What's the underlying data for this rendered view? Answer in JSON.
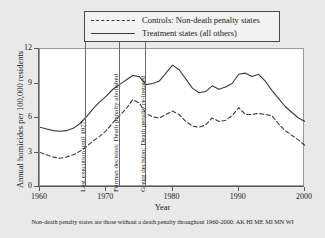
{
  "legend": {
    "items": [
      {
        "label": "Controls: Non-death penalty states",
        "style": "dashed",
        "key_name": "dashed-line-key"
      },
      {
        "label": "Treatment states (all others)",
        "style": "solid",
        "key_name": "solid-line-key"
      }
    ]
  },
  "axes": {
    "ylabel": "Annual homicides per 100,000 residents",
    "xlabel": "Year",
    "yticks": [
      "0",
      "3",
      "6",
      "9",
      "12"
    ],
    "xticks": [
      "1960",
      "1970",
      "1980",
      "1990",
      "2000"
    ]
  },
  "annotations": [
    {
      "year": 1967,
      "text": "Last execution until 1977"
    },
    {
      "year": 1972,
      "text": "Furman decision: Death penalty abolished"
    },
    {
      "year": 1976,
      "text": "Gregg decision: Death penalty re-instated"
    }
  ],
  "footnote": "Non-death penalty states are those without a death penalty throughout 1960-2000: AK HI ME MI MN WI",
  "colors": {
    "treatment_line": "#3a3a3a",
    "control_line": "#3a3a3a",
    "event_line": "#6a6a6a",
    "plot_background": "#ffffff",
    "figure_background": "#e9e9e9",
    "axis": "#5a5a5a"
  },
  "chart_data": {
    "type": "line",
    "title": "",
    "xlabel": "Year",
    "ylabel": "Annual homicides per 100,000 residents",
    "xlim": [
      1960,
      2000
    ],
    "ylim": [
      0,
      12
    ],
    "grid": false,
    "legend_position": "top-center",
    "x": [
      1960,
      1961,
      1962,
      1963,
      1964,
      1965,
      1966,
      1967,
      1968,
      1969,
      1970,
      1971,
      1972,
      1973,
      1974,
      1975,
      1976,
      1977,
      1978,
      1979,
      1980,
      1981,
      1982,
      1983,
      1984,
      1985,
      1986,
      1987,
      1988,
      1989,
      1990,
      1991,
      1992,
      1993,
      1994,
      1995,
      1996,
      1997,
      1998,
      1999,
      2000
    ],
    "series": [
      {
        "name": "Treatment states (all others)",
        "style": "solid",
        "values": [
          5.2,
          5.05,
          4.9,
          4.85,
          4.9,
          5.1,
          5.5,
          6.1,
          6.8,
          7.4,
          7.9,
          8.5,
          8.9,
          9.3,
          9.7,
          9.6,
          8.9,
          9.0,
          9.2,
          9.9,
          10.6,
          10.2,
          9.4,
          8.6,
          8.2,
          8.3,
          8.8,
          8.5,
          8.7,
          9.0,
          9.8,
          9.9,
          9.6,
          9.8,
          9.2,
          8.4,
          7.7,
          7.0,
          6.5,
          6.0,
          5.7
        ]
      },
      {
        "name": "Controls: Non-death penalty states",
        "style": "dashed",
        "values": [
          3.0,
          2.8,
          2.6,
          2.5,
          2.6,
          2.8,
          3.1,
          3.5,
          4.0,
          4.4,
          4.9,
          5.6,
          6.2,
          6.8,
          7.6,
          7.3,
          6.4,
          6.1,
          6.0,
          6.3,
          6.6,
          6.3,
          5.7,
          5.3,
          5.2,
          5.4,
          6.0,
          5.7,
          5.8,
          6.2,
          6.9,
          6.3,
          6.3,
          6.4,
          6.3,
          6.2,
          5.5,
          4.9,
          4.5,
          4.1,
          3.6
        ]
      }
    ]
  }
}
